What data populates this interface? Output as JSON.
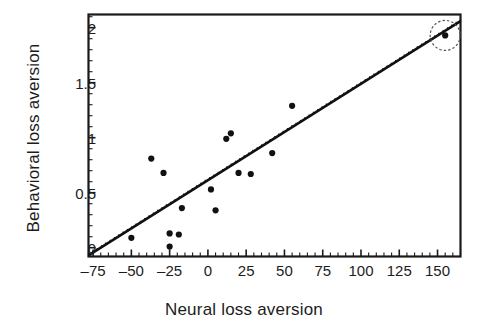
{
  "figure": {
    "kind": "scatter-plot",
    "background_color": "#ffffff",
    "ink_color": "#111111"
  },
  "axes": {
    "x_title": "Neural loss aversion",
    "y_title": "Behavioral loss aversion",
    "x_tick_labels": [
      "–75",
      "–50",
      "–25",
      "0",
      "25",
      "50",
      "75",
      "100",
      "125",
      "150"
    ],
    "y_tick_labels": [
      "0",
      "0.5",
      "1",
      "1.5",
      "2"
    ]
  },
  "annotations": {
    "outlier_highlight": "dashed-circle"
  },
  "chart_data": {
    "type": "scatter",
    "title": "",
    "xlabel": "Neural loss aversion",
    "ylabel": "Behavioral loss aversion",
    "xlim": [
      -78,
      165
    ],
    "ylim": [
      -0.08,
      2.12
    ],
    "xticks": [
      -75,
      -50,
      -25,
      0,
      25,
      50,
      75,
      100,
      125,
      150
    ],
    "yticks": [
      0,
      0.5,
      1,
      1.5,
      2
    ],
    "x_minor_ticks_per_interval": 5,
    "y_minor_ticks_per_interval": 5,
    "grid": false,
    "legend": null,
    "series": [
      {
        "name": "Participants",
        "marker": "filled-circle",
        "color": "#111111",
        "points": [
          {
            "x": -50,
            "y": 0.09
          },
          {
            "x": -37,
            "y": 0.81
          },
          {
            "x": -29,
            "y": 0.68
          },
          {
            "x": -25,
            "y": 0.13
          },
          {
            "x": -25,
            "y": 0.01
          },
          {
            "x": -19,
            "y": 0.12
          },
          {
            "x": -17,
            "y": 0.36
          },
          {
            "x": 2,
            "y": 0.53
          },
          {
            "x": 5,
            "y": 0.34
          },
          {
            "x": 12,
            "y": 0.99
          },
          {
            "x": 15,
            "y": 1.04
          },
          {
            "x": 20,
            "y": 0.68
          },
          {
            "x": 28,
            "y": 0.67
          },
          {
            "x": 42,
            "y": 0.86
          },
          {
            "x": 55,
            "y": 1.29
          },
          {
            "x": 155,
            "y": 1.93
          }
        ]
      }
    ],
    "fit_line": {
      "name": "Regression line",
      "style": "dotted-thick",
      "color": "#111111",
      "x_start": -78,
      "y_start": -0.07,
      "x_end": 165,
      "y_end": 2.06
    },
    "highlight": {
      "type": "dashed-circle",
      "x": 155,
      "y": 1.93,
      "radius_px": 15,
      "stroke_color": "#555555"
    }
  }
}
